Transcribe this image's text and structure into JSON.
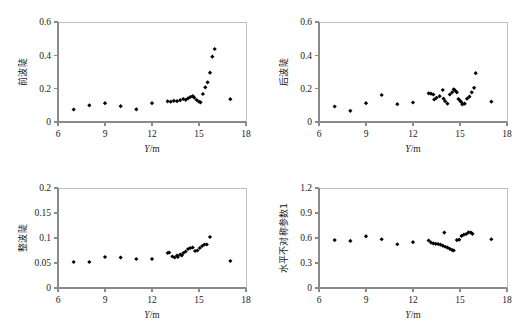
{
  "figure": {
    "background": "#ffffff",
    "point_color": "#000000",
    "axis_color": "#8a8a8a",
    "frame_color": "#b9b9b9",
    "panel_count": 4
  },
  "shared": {
    "xlabel_var": "Y",
    "xlabel_unit": "/m",
    "xlabel_full": "Y/m",
    "x_ticks": [
      "6",
      "9",
      "12",
      "15",
      "18"
    ],
    "x_tick_values": [
      6,
      9,
      12,
      15,
      18
    ],
    "xlim": [
      6,
      18
    ]
  },
  "chart_data": [
    {
      "type": "scatter",
      "panel": "top-left",
      "title": "",
      "xlabel": "Y/m",
      "ylabel": "前波陡",
      "xlim": [
        6,
        18
      ],
      "ylim": [
        0,
        0.6
      ],
      "grid": false,
      "legend": "none",
      "x_ticks": [
        6,
        9,
        12,
        15,
        18
      ],
      "y_ticks": [
        0,
        0.2,
        0.4,
        0.6
      ],
      "y_tick_labels": [
        "0",
        "0.2",
        "0.4",
        "0.6"
      ],
      "marker": "diamond",
      "points": [
        [
          7.0,
          0.075
        ],
        [
          8.0,
          0.1
        ],
        [
          9.0,
          0.113
        ],
        [
          10.0,
          0.095
        ],
        [
          11.0,
          0.076
        ],
        [
          12.0,
          0.113
        ],
        [
          13.0,
          0.124
        ],
        [
          13.2,
          0.122
        ],
        [
          13.4,
          0.127
        ],
        [
          13.6,
          0.125
        ],
        [
          13.8,
          0.131
        ],
        [
          14.0,
          0.138
        ],
        [
          14.15,
          0.133
        ],
        [
          14.3,
          0.142
        ],
        [
          14.45,
          0.15
        ],
        [
          14.6,
          0.156
        ],
        [
          14.7,
          0.146
        ],
        [
          14.85,
          0.132
        ],
        [
          15.0,
          0.122
        ],
        [
          15.1,
          0.118
        ],
        [
          15.25,
          0.168
        ],
        [
          15.4,
          0.208
        ],
        [
          15.55,
          0.238
        ],
        [
          15.7,
          0.296
        ],
        [
          15.85,
          0.392
        ],
        [
          16.0,
          0.438
        ],
        [
          17.0,
          0.137
        ]
      ]
    },
    {
      "type": "scatter",
      "panel": "top-right",
      "title": "",
      "xlabel": "Y/m",
      "ylabel": "后波陡",
      "xlim": [
        6,
        18
      ],
      "ylim": [
        0,
        0.6
      ],
      "grid": false,
      "legend": "none",
      "x_ticks": [
        6,
        9,
        12,
        15,
        18
      ],
      "y_ticks": [
        0,
        0.2,
        0.4,
        0.6
      ],
      "y_tick_labels": [
        "0",
        "0.2",
        "0.4",
        "0.6"
      ],
      "marker": "diamond",
      "points": [
        [
          7.0,
          0.093
        ],
        [
          8.0,
          0.067
        ],
        [
          9.0,
          0.113
        ],
        [
          10.0,
          0.162
        ],
        [
          11.0,
          0.107
        ],
        [
          12.0,
          0.117
        ],
        [
          13.0,
          0.172
        ],
        [
          13.15,
          0.17
        ],
        [
          13.3,
          0.165
        ],
        [
          13.35,
          0.135
        ],
        [
          13.5,
          0.145
        ],
        [
          13.7,
          0.155
        ],
        [
          13.9,
          0.192
        ],
        [
          13.95,
          0.14
        ],
        [
          14.05,
          0.125
        ],
        [
          14.2,
          0.11
        ],
        [
          14.35,
          0.165
        ],
        [
          14.5,
          0.178
        ],
        [
          14.6,
          0.196
        ],
        [
          14.7,
          0.188
        ],
        [
          14.8,
          0.178
        ],
        [
          14.9,
          0.138
        ],
        [
          15.0,
          0.128
        ],
        [
          15.1,
          0.118
        ],
        [
          15.15,
          0.105
        ],
        [
          15.3,
          0.11
        ],
        [
          15.45,
          0.14
        ],
        [
          15.6,
          0.152
        ],
        [
          15.75,
          0.178
        ],
        [
          15.9,
          0.205
        ],
        [
          16.0,
          0.293
        ],
        [
          17.0,
          0.122
        ]
      ]
    },
    {
      "type": "scatter",
      "panel": "bottom-left",
      "title": "",
      "xlabel": "Y/m",
      "ylabel": "整波陡",
      "xlim": [
        6,
        18
      ],
      "ylim": [
        0,
        0.2
      ],
      "grid": false,
      "legend": "none",
      "x_ticks": [
        6,
        9,
        12,
        15,
        18
      ],
      "y_ticks": [
        0,
        0.05,
        0.1,
        0.15,
        0.2
      ],
      "y_tick_labels": [
        "0",
        "0.05",
        "0.1",
        "0.15",
        "0.2"
      ],
      "marker": "diamond",
      "points": [
        [
          7.0,
          0.052
        ],
        [
          8.0,
          0.052
        ],
        [
          9.0,
          0.062
        ],
        [
          10.0,
          0.061
        ],
        [
          11.0,
          0.058
        ],
        [
          12.0,
          0.058
        ],
        [
          13.0,
          0.07
        ],
        [
          13.1,
          0.071
        ],
        [
          13.3,
          0.063
        ],
        [
          13.45,
          0.061
        ],
        [
          13.6,
          0.065
        ],
        [
          13.65,
          0.062
        ],
        [
          13.8,
          0.067
        ],
        [
          13.9,
          0.065
        ],
        [
          14.0,
          0.07
        ],
        [
          14.15,
          0.073
        ],
        [
          14.3,
          0.078
        ],
        [
          14.45,
          0.08
        ],
        [
          14.6,
          0.081
        ],
        [
          14.75,
          0.074
        ],
        [
          14.9,
          0.075
        ],
        [
          15.05,
          0.08
        ],
        [
          15.2,
          0.084
        ],
        [
          15.35,
          0.087
        ],
        [
          15.5,
          0.087
        ],
        [
          15.7,
          0.102
        ],
        [
          17.0,
          0.054
        ]
      ]
    },
    {
      "type": "scatter",
      "panel": "bottom-right",
      "title": "",
      "xlabel": "Y/m",
      "ylabel": "水平不对称参数1",
      "xlim": [
        6,
        18
      ],
      "ylim": [
        0,
        1.2
      ],
      "grid": false,
      "legend": "none",
      "x_ticks": [
        6,
        9,
        12,
        15,
        18
      ],
      "y_ticks": [
        0,
        0.3,
        0.6,
        0.9,
        1.2
      ],
      "y_tick_labels": [
        "0",
        "0.3",
        "0.6",
        "0.9",
        "1.2"
      ],
      "marker": "diamond",
      "points": [
        [
          7.0,
          0.575
        ],
        [
          8.0,
          0.565
        ],
        [
          9.0,
          0.62
        ],
        [
          10.0,
          0.585
        ],
        [
          11.0,
          0.525
        ],
        [
          12.0,
          0.55
        ],
        [
          13.0,
          0.57
        ],
        [
          13.15,
          0.545
        ],
        [
          13.3,
          0.535
        ],
        [
          13.45,
          0.53
        ],
        [
          13.6,
          0.528
        ],
        [
          13.75,
          0.52
        ],
        [
          13.9,
          0.508
        ],
        [
          14.0,
          0.665
        ],
        [
          14.05,
          0.495
        ],
        [
          14.2,
          0.485
        ],
        [
          14.35,
          0.47
        ],
        [
          14.5,
          0.455
        ],
        [
          14.6,
          0.45
        ],
        [
          14.8,
          0.575
        ],
        [
          14.95,
          0.58
        ],
        [
          15.1,
          0.625
        ],
        [
          15.25,
          0.64
        ],
        [
          15.4,
          0.648
        ],
        [
          15.55,
          0.668
        ],
        [
          15.7,
          0.665
        ],
        [
          15.8,
          0.65
        ],
        [
          17.0,
          0.585
        ]
      ]
    }
  ]
}
